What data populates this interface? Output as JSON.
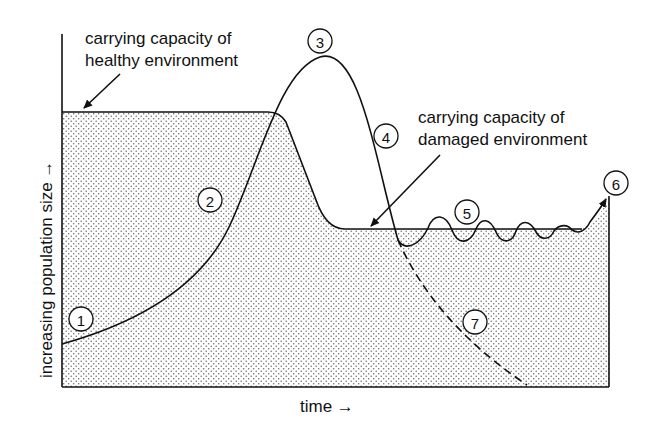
{
  "diagram": {
    "y_axis_label": "increasing population size →",
    "x_axis_label": "time →",
    "annotations": {
      "healthy_line1": "carrying capacity of",
      "healthy_line2": "healthy environment",
      "damaged_line1": "carrying capacity of",
      "damaged_line2": "damaged environment"
    },
    "markers": [
      {
        "id": "1",
        "label": "1"
      },
      {
        "id": "2",
        "label": "2"
      },
      {
        "id": "3",
        "label": "3"
      },
      {
        "id": "4",
        "label": "4"
      },
      {
        "id": "5",
        "label": "5"
      },
      {
        "id": "6",
        "label": "6"
      },
      {
        "id": "7",
        "label": "7"
      }
    ],
    "colors": {
      "ink": "#111111",
      "shade_dots": "#777777",
      "background": "#ffffff"
    }
  }
}
